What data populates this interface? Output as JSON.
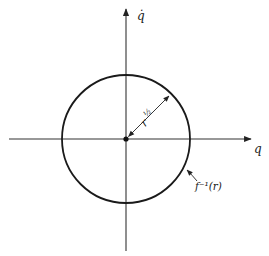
{
  "diagram": {
    "type": "phase-plane",
    "axes": {
      "x_label": "q",
      "y_label": "q̇"
    },
    "circle": {
      "radius_label_base": "r",
      "radius_label_exp": "½",
      "curve_label": "f⁻¹(r)"
    },
    "colors": {
      "line": "#1a1a1a",
      "axis": "#333333",
      "background": "#ffffff"
    }
  }
}
